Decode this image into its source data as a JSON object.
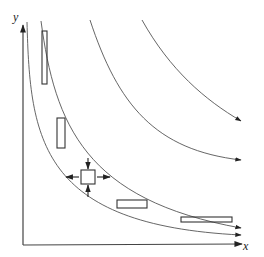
{
  "figure": {
    "type": "streamline-diagram",
    "axes": {
      "x_label": "x",
      "y_label": "y"
    },
    "streamlines": [
      {
        "id": 1,
        "label": "innermost",
        "points": "M 22 20 C 26 120, 38 205, 240 233"
      },
      {
        "id": 2,
        "label": "element-path",
        "points": "M 41 21 C 50 110, 80 195, 240 223"
      },
      {
        "id": 3,
        "label": "third",
        "points": "M 90 18 C 115 95, 150 145, 240 160"
      },
      {
        "id": 4,
        "label": "outer",
        "points": "M 140 18 C 170 70, 205 102, 240 121"
      }
    ],
    "fluid_elements": [
      {
        "id": "tall-element",
        "x": 42,
        "y": 31,
        "w": 5,
        "h": 53
      },
      {
        "id": "mid-element",
        "x": 57,
        "y": 118,
        "w": 8,
        "h": 30
      },
      {
        "id": "square-element",
        "x": 81,
        "y": 170,
        "w": 14,
        "h": 14,
        "with_arrows": true
      },
      {
        "id": "wide-element",
        "x": 117,
        "y": 200,
        "w": 30,
        "h": 8
      },
      {
        "id": "flat-element",
        "x": 181,
        "y": 217,
        "w": 51,
        "h": 5
      }
    ],
    "colors": {
      "line": "#555555",
      "axis": "#444444",
      "arrow": "#222222",
      "element": "#333333"
    }
  }
}
